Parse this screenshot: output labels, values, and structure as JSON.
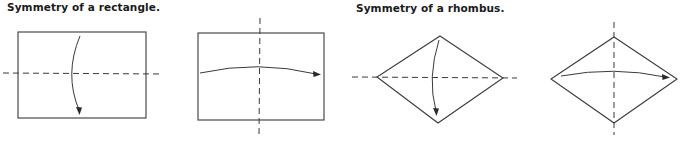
{
  "figures": {
    "rectangle": {
      "title": "Symmetry of a rectangle.",
      "panels": [
        {
          "shape": "rectangle",
          "axis_of_symmetry": "horizontal",
          "fold_arrow": "top-to-bottom"
        },
        {
          "shape": "rectangle",
          "axis_of_symmetry": "vertical",
          "fold_arrow": "left-to-right"
        }
      ]
    },
    "rhombus": {
      "title": "Symmetry of a rhombus.",
      "panels": [
        {
          "shape": "rhombus",
          "axis_of_symmetry": "horizontal",
          "fold_arrow": "top-to-bottom"
        },
        {
          "shape": "rhombus",
          "axis_of_symmetry": "vertical",
          "fold_arrow": "left-to-right"
        }
      ]
    }
  },
  "colors": {
    "line": "#3a3a3a",
    "text": "#1a1a1a",
    "background": "#ffffff"
  }
}
